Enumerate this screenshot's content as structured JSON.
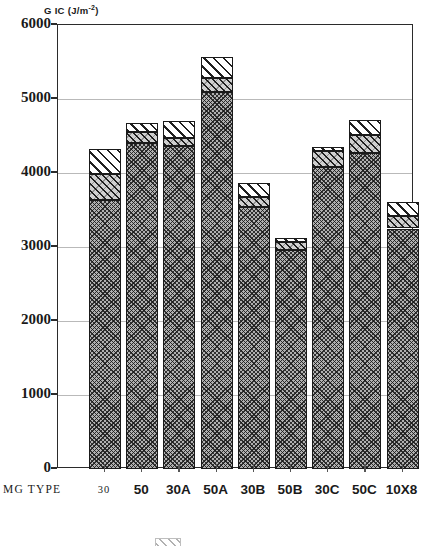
{
  "chart_data": {
    "type": "bar",
    "title": "",
    "subtitle": "",
    "ylabel": "G IC (J/m -2)",
    "ylabel_main": "G IC (J/m",
    "ylabel_sup": "-2",
    "ylabel_close": ")",
    "xlabel": "MG TYPE",
    "ylim": [
      0,
      6000
    ],
    "ytick_values": [
      0,
      1000,
      2000,
      3000,
      4000,
      5000,
      6000
    ],
    "ytick_labels": [
      "0",
      "1000",
      "2000",
      "3000",
      "4000",
      "5000",
      "6000"
    ],
    "grid": true,
    "grid_axis": "y",
    "legend": "",
    "legend_position": "bottom",
    "stacked": true,
    "categories": [
      "30",
      "50",
      "30A",
      "50A",
      "30B",
      "50B",
      "30C",
      "50C",
      "10X8"
    ],
    "series": [
      {
        "name": "lower-band",
        "pattern": "dark-crosshatch",
        "values": [
          3630,
          4400,
          4360,
          5100,
          3540,
          2960,
          4080,
          4270,
          3250
        ]
      },
      {
        "name": "mid-band",
        "pattern": "medium-hatch",
        "values": [
          3990,
          4550,
          4470,
          5290,
          3680,
          3070,
          4300,
          4510,
          3420
        ]
      },
      {
        "name": "upper-band",
        "pattern": "light-hatch",
        "values": [
          4330,
          4680,
          4700,
          5570,
          3860,
          3120,
          4350,
          4720,
          3610
        ]
      }
    ],
    "bar_totals": [
      4330,
      4680,
      4700,
      5570,
      3860,
      3120,
      4350,
      4720,
      3610
    ]
  },
  "axis": {
    "y_title_text": "G IC (J/m",
    "y_title_sup": "-2",
    "y_title_tail": ")",
    "x_row_label": "MG  TYPE"
  }
}
